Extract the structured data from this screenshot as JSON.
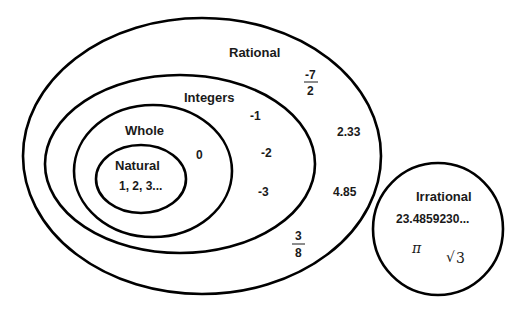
{
  "diagram": {
    "type": "venn/nested sets",
    "sets": {
      "rational": {
        "label": "Rational",
        "members": [
          "-7/2",
          "2.33",
          "4.85",
          "3/8"
        ]
      },
      "integers": {
        "label": "Integers",
        "members": [
          "-1",
          "-2",
          "-3"
        ]
      },
      "whole": {
        "label": "Whole",
        "members": [
          "0"
        ]
      },
      "natural": {
        "label": "Natural",
        "members": [
          "1, 2, 3..."
        ]
      },
      "irrational": {
        "label": "Irrational",
        "members": [
          "23.4859230...",
          "π",
          "√3"
        ]
      }
    },
    "texts": {
      "rational_label": "Rational",
      "integers_label": "Integers",
      "whole_label": "Whole",
      "natural_label": "Natural",
      "irrational_label": "Irrational",
      "natural_members": "1, 2, 3...",
      "zero": "0",
      "neg1": "-1",
      "neg2": "-2",
      "neg3": "-3",
      "frac1_num": "-7",
      "frac1_den": "2",
      "dec1": "2.33",
      "dec2": "4.85",
      "frac2_num": "3",
      "frac2_den": "8",
      "irr_decimal": "23.4859230...",
      "pi": "π",
      "sqrt": "√",
      "sqrt_arg": "3"
    }
  }
}
